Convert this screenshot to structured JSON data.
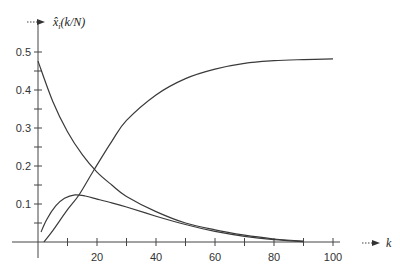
{
  "chart_data": {
    "type": "line",
    "title": "",
    "xlabel": "k",
    "ylabel": "x̂ᵢ(k/N)",
    "xlim": [
      0,
      110
    ],
    "ylim": [
      0,
      0.55
    ],
    "x_ticks": [
      10,
      20,
      30,
      40,
      50,
      60,
      70,
      80,
      90,
      100
    ],
    "x_tick_labels": [
      "20",
      "40",
      "60",
      "80",
      "100"
    ],
    "x_tick_label_values": [
      20,
      40,
      60,
      80,
      100
    ],
    "y_ticks": [
      0.05,
      0.1,
      0.15,
      0.2,
      0.25,
      0.3,
      0.35,
      0.4,
      0.45,
      0.5
    ],
    "y_tick_labels": [
      "0.1",
      "0.2",
      "0.3",
      "0.4",
      "0.5"
    ],
    "y_tick_label_values": [
      0.1,
      0.2,
      0.3,
      0.4,
      0.5
    ],
    "grid": false,
    "legend": null,
    "series": [
      {
        "name": "decaying",
        "x": [
          0,
          5,
          10,
          15,
          20,
          25,
          30,
          40,
          50,
          60,
          70,
          80,
          90
        ],
        "values": [
          0.476,
          0.37,
          0.29,
          0.23,
          0.184,
          0.15,
          0.12,
          0.08,
          0.05,
          0.032,
          0.018,
          0.008,
          0.002
        ]
      },
      {
        "name": "hump",
        "x": [
          1,
          3,
          6,
          9,
          12.5,
          16,
          20,
          25,
          30,
          40,
          50,
          60,
          70,
          80,
          90
        ],
        "values": [
          0.026,
          0.06,
          0.095,
          0.115,
          0.124,
          0.121,
          0.113,
          0.103,
          0.092,
          0.068,
          0.046,
          0.028,
          0.015,
          0.006,
          0.001
        ]
      },
      {
        "name": "rising",
        "x": [
          2,
          5,
          10,
          14,
          19,
          25,
          30,
          40,
          50,
          60,
          70,
          80,
          90,
          100
        ],
        "values": [
          0.0,
          0.03,
          0.085,
          0.125,
          0.19,
          0.265,
          0.32,
          0.387,
          0.43,
          0.455,
          0.47,
          0.477,
          0.48,
          0.482
        ]
      }
    ]
  },
  "axes": {
    "x_label": "k",
    "y_label_base": "x̂",
    "y_label_sub": "i",
    "y_label_rest": "(k/N)"
  }
}
